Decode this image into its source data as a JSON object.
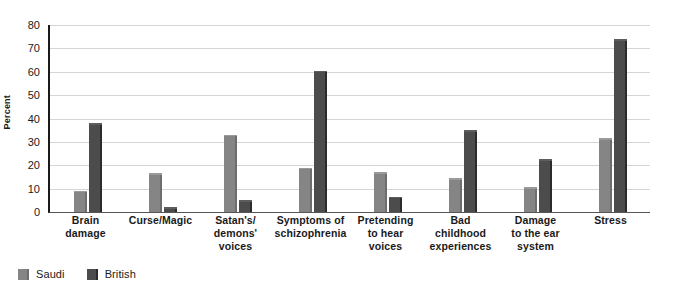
{
  "chart_data": {
    "type": "bar",
    "title": "",
    "subtitle": "",
    "xlabel": "",
    "ylabel": "Percent",
    "ylim": [
      0,
      80
    ],
    "yticks": [
      0,
      10,
      20,
      30,
      40,
      50,
      60,
      70,
      80
    ],
    "grid": true,
    "legend_position": "bottom-left",
    "categories": [
      "Brain damage",
      "Curse/Magic",
      "Satan's/ demons' voices",
      "Symptoms of schizophrenia",
      "Pretending to hear voices",
      "Bad childhood experiences",
      "Damage to the ear system",
      "Stress"
    ],
    "category_lines": [
      [
        "Brain",
        "damage"
      ],
      [
        "Curse/Magic"
      ],
      [
        "Satan's/",
        "demons'",
        "voices"
      ],
      [
        "Symptoms of",
        "schizophrenia"
      ],
      [
        "Pretending",
        "to hear",
        "voices"
      ],
      [
        "Bad",
        "childhood",
        "experiences"
      ],
      [
        "Damage",
        "to the ear",
        "system"
      ],
      [
        "Stress"
      ]
    ],
    "series": [
      {
        "name": "Saudi",
        "color": "#858585",
        "values": [
          9,
          16.5,
          33,
          19,
          17,
          14.5,
          10.5,
          31.5
        ]
      },
      {
        "name": "British",
        "color": "#4c4c4c",
        "values": [
          38,
          2,
          5,
          60.5,
          6.5,
          35,
          22.5,
          74
        ]
      }
    ]
  },
  "legend": {
    "items": [
      {
        "label": "Saudi"
      },
      {
        "label": "British"
      }
    ]
  },
  "axis": {
    "y_title": "Percent",
    "tick_labels": [
      "80",
      "70",
      "60",
      "50",
      "40",
      "30",
      "20",
      "10",
      "0"
    ]
  }
}
